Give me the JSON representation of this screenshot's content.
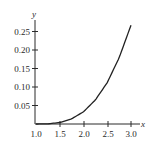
{
  "chart_data": {
    "type": "line",
    "title": "",
    "xlabel": "x",
    "ylabel": "y",
    "xlim": [
      1.0,
      3.0
    ],
    "ylim": [
      0,
      0.27
    ],
    "grid": false,
    "legend": null,
    "x_ticks": [
      "1.0",
      "1.5",
      "2.0",
      "2.5",
      "3.0"
    ],
    "y_ticks": [
      "0.05",
      "0.10",
      "0.15",
      "0.20",
      "0.25"
    ],
    "series": [
      {
        "name": "curve",
        "color": "#222222",
        "x": [
          1.0,
          1.25,
          1.5,
          1.75,
          2.0,
          2.25,
          2.5,
          2.75,
          3.0
        ],
        "y": [
          0.0,
          0.0005,
          0.004,
          0.014,
          0.033,
          0.065,
          0.112,
          0.179,
          0.267
        ]
      }
    ]
  },
  "labels": {
    "x_axis": "x",
    "y_axis": "y",
    "x_ticks": [
      "1.0",
      "1.5",
      "2.0",
      "2.5",
      "3.0"
    ],
    "y_ticks": [
      "0.05",
      "0.10",
      "0.15",
      "0.20",
      "0.25"
    ]
  }
}
